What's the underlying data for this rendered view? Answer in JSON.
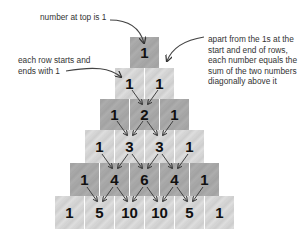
{
  "annotations": {
    "top": "number at top is 1",
    "edges_line1": "each row starts and",
    "edges_line2": "ends with  1",
    "sum_line1": "apart from the 1s at the",
    "sum_line2": "start and end of rows,",
    "sum_line3": "each number equals the",
    "sum_line4": "sum of the two numbers",
    "sum_line5": "diagonally above it"
  },
  "pyramid": {
    "rows": [
      [
        "1"
      ],
      [
        "1",
        "1"
      ],
      [
        "1",
        "2",
        "1"
      ],
      [
        "1",
        "3",
        "3",
        "1"
      ],
      [
        "1",
        "4",
        "6",
        "4",
        "1"
      ],
      [
        "1",
        "5",
        "10",
        "10",
        "5",
        "1"
      ]
    ]
  },
  "colors": {
    "light_block": "#d6d6d6",
    "dark_block": "#a8a8a8",
    "arrow": "#333333",
    "text": "#333333"
  }
}
